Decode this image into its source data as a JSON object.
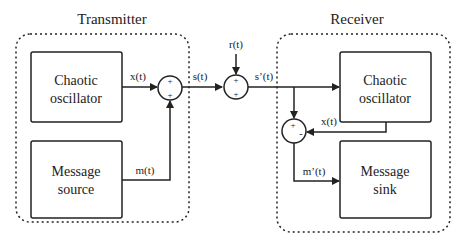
{
  "transmitter": {
    "title": "Transmitter",
    "chaotic_oscillator": {
      "line1": "Chaotic",
      "line2": "oscillator"
    },
    "message_source": {
      "line1": "Message",
      "line2": "source"
    },
    "adder": {
      "top_sign": "+",
      "bottom_sign": "+"
    },
    "signals": {
      "x": "x(t)",
      "m": "m(t)"
    }
  },
  "channel": {
    "signals": {
      "s": "s(t)",
      "r": "r(t)",
      "s_prime": "s’(t)"
    },
    "adder": {
      "top_sign": "+",
      "bottom_sign": "+"
    }
  },
  "receiver": {
    "title": "Receiver",
    "chaotic_oscillator": {
      "line1": "Chaotic",
      "line2": "oscillator"
    },
    "message_sink": {
      "line1": "Message",
      "line2": "sink"
    },
    "subtractor": {
      "top_sign": "+",
      "right_sign": "-"
    },
    "signals": {
      "x": "x(t)",
      "m_prime": "m’(t)"
    }
  },
  "colors": {
    "stroke": "#222222",
    "background": "#ffffff"
  }
}
